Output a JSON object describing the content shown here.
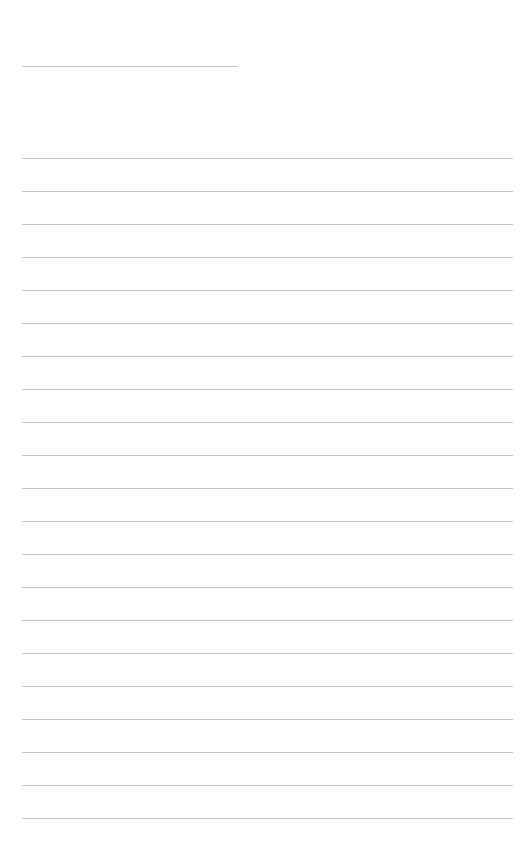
{
  "page": {
    "type": "lined-notepaper",
    "background_color": "#ffffff",
    "line_color": "#c4c4c4",
    "title_line": {
      "present": true
    },
    "ruled_lines": {
      "count": 21,
      "spacing_px": 33
    },
    "written_text": []
  }
}
